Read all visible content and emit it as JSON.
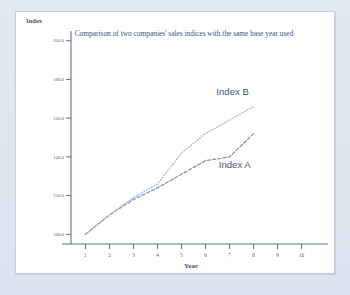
{
  "chart_data": {
    "type": "line",
    "title": "Comparison of two companies' sales indices with the same base year used",
    "xlabel": "Year",
    "ylabel": "Index",
    "xlim": [
      0.4,
      10.6
    ],
    "ylim": [
      95,
      205
    ],
    "grid": false,
    "legend_position": "inline-annotation",
    "xticks": [
      "1",
      "2",
      "3",
      "4",
      "5",
      "6",
      "7",
      "8",
      "9",
      "10"
    ],
    "xtick_values": [
      1,
      2,
      3,
      4,
      5,
      6,
      7,
      8,
      9,
      10
    ],
    "yticks": [
      "100.0",
      "120.0",
      "140.0",
      "160.0",
      "180.0",
      "200.0"
    ],
    "ytick_values": [
      100,
      120,
      140,
      160,
      180,
      200
    ],
    "x": [
      1,
      2,
      3,
      4,
      5,
      6,
      7,
      8
    ],
    "series": [
      {
        "name": "Index A",
        "label": "Index A",
        "color": "#7b8cb8",
        "style": "dashed",
        "values": [
          100,
          110,
          118,
          124,
          131,
          138,
          140,
          152
        ],
        "label_x": 6.55,
        "label_y": 134
      },
      {
        "name": "Index B",
        "label": "Index B",
        "color": "#a3b2d2",
        "style": "dotted",
        "values": [
          100,
          110,
          119,
          126,
          142,
          152,
          159,
          166
        ],
        "label_x": 6.45,
        "label_y": 172
      }
    ]
  },
  "colors": {
    "page_background": "#dfe6f0",
    "card_background": "#ffffff",
    "axis": "#5d6f96",
    "text": "#3f5685",
    "series_a": "#7b8cb8",
    "series_b": "#a3b2d2"
  }
}
